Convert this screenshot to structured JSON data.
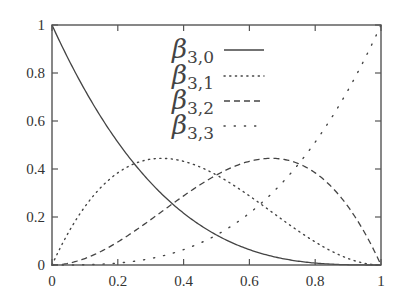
{
  "chart_data": {
    "type": "line",
    "title": "",
    "xlabel": "",
    "ylabel": "",
    "xlim": [
      0,
      1
    ],
    "ylim": [
      0,
      1
    ],
    "grid": false,
    "legend_position": "upper-center",
    "x_ticks": [
      "0",
      "0.2",
      "0.4",
      "0.6",
      "0.8",
      "1"
    ],
    "y_ticks": [
      "0",
      "0.2",
      "0.4",
      "0.6",
      "0.8",
      "1"
    ],
    "x": [
      0,
      0.05,
      0.1,
      0.15,
      0.2,
      0.25,
      0.3,
      0.35,
      0.4,
      0.45,
      0.5,
      0.55,
      0.6,
      0.65,
      0.7,
      0.75,
      0.8,
      0.85,
      0.9,
      0.95,
      1
    ],
    "series": [
      {
        "name": "β3,0",
        "base": "β",
        "sub": "3,0",
        "style": "solid",
        "formula": "(1-t)^3",
        "values": [
          1,
          0.857,
          0.729,
          0.614,
          0.512,
          0.422,
          0.343,
          0.275,
          0.216,
          0.166,
          0.125,
          0.091,
          0.064,
          0.043,
          0.027,
          0.016,
          0.008,
          0.003,
          0.001,
          0.0001,
          0
        ]
      },
      {
        "name": "β3,1",
        "base": "β",
        "sub": "3,1",
        "style": "dotted",
        "formula": "3t(1-t)^2",
        "values": [
          0,
          0.135,
          0.243,
          0.325,
          0.384,
          0.422,
          0.441,
          0.444,
          0.432,
          0.408,
          0.375,
          0.334,
          0.288,
          0.239,
          0.189,
          0.141,
          0.096,
          0.057,
          0.027,
          0.007,
          0
        ]
      },
      {
        "name": "β3,2",
        "base": "β",
        "sub": "3,2",
        "style": "dashed",
        "formula": "3t^2(1-t)",
        "values": [
          0,
          0.007,
          0.027,
          0.057,
          0.096,
          0.141,
          0.189,
          0.239,
          0.288,
          0.334,
          0.375,
          0.408,
          0.432,
          0.444,
          0.441,
          0.422,
          0.384,
          0.325,
          0.243,
          0.135,
          0
        ]
      },
      {
        "name": "β3,3",
        "base": "β",
        "sub": "3,3",
        "style": "sparse-dotted",
        "formula": "t^3",
        "values": [
          0,
          0.0001,
          0.001,
          0.003,
          0.008,
          0.016,
          0.027,
          0.043,
          0.064,
          0.091,
          0.125,
          0.166,
          0.216,
          0.275,
          0.343,
          0.422,
          0.512,
          0.614,
          0.729,
          0.857,
          1
        ]
      }
    ]
  },
  "colors": {
    "axis": "#555555",
    "line": "#444444",
    "background": "#ffffff"
  }
}
